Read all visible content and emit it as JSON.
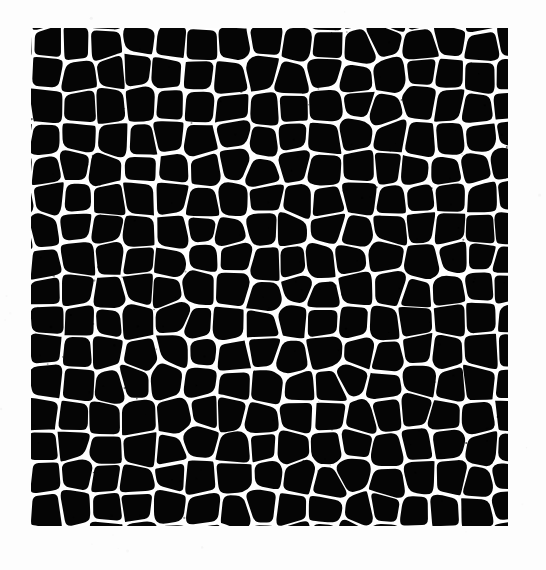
{
  "page": {
    "width": 546,
    "height": 570,
    "background_color": "#fdfdfd",
    "caption": ""
  },
  "micrograph": {
    "name": "cellular-structure-micrograph",
    "crop_box": {
      "x": 31,
      "y": 28,
      "width": 477,
      "height": 498
    },
    "foreground_color": "#000000",
    "wall_color": "#ffffff",
    "cell_fill_color": "#050505",
    "image_type": "binary-threshold-micrograph",
    "structure": "polygonal cells separated by thin bright walls",
    "approx_columns": 16,
    "approx_rows": 16,
    "approx_cell_pitch_px": 31,
    "wall_thickness_px": 2.6,
    "node_blob_radius_px": 3.2,
    "jitter_amount_px": 6,
    "random_seed": 20240613
  },
  "chart_data": {
    "type": "heatmap",
    "title": "",
    "xlabel": "",
    "ylabel": "",
    "grid": false,
    "legend": "none",
    "categories": [
      "cell-interior",
      "cell-wall"
    ],
    "values": [
      0,
      1
    ],
    "colors": [
      "#000000",
      "#ffffff"
    ]
  }
}
